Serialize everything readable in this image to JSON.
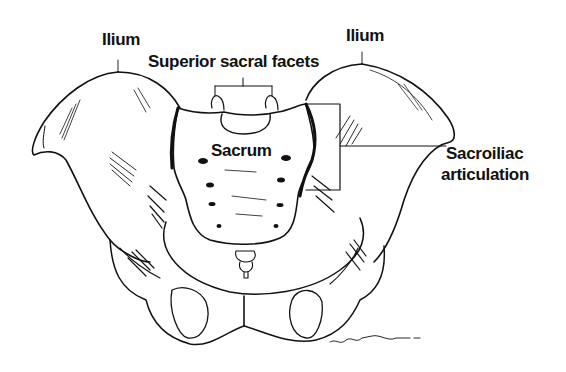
{
  "figure": {
    "labels": {
      "ilium_left": "Ilium",
      "ilium_right": "Ilium",
      "superior_sacral_facets": "Superior sacral facets",
      "sacrum": "Sacrum",
      "sacroiliac_line1": "Sacroiliac",
      "sacroiliac_line2": "articulation"
    },
    "colors": {
      "ink": "#111111",
      "background": "#ffffff"
    }
  }
}
